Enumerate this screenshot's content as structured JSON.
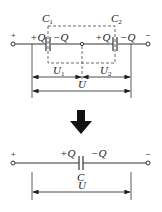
{
  "diagram": {
    "top": {
      "capacitors": [
        {
          "name": "C",
          "subscript": "1",
          "left_charge": "+Q",
          "right_charge": "−Q"
        },
        {
          "name": "C",
          "subscript": "2",
          "left_charge": "+Q",
          "right_charge": "−Q"
        }
      ],
      "terminals": {
        "left": "+",
        "right": "−"
      },
      "voltages": [
        {
          "name": "U",
          "subscript": "1"
        },
        {
          "name": "U",
          "subscript": "2"
        }
      ],
      "total_voltage": "U"
    },
    "arrow": "down",
    "bottom": {
      "capacitor": {
        "name": "C",
        "left_charge": "+Q",
        "right_charge": "−Q"
      },
      "terminals": {
        "left": "+",
        "right": "−"
      },
      "total_voltage": "U"
    },
    "colors": {
      "line": "#333333",
      "background": "#ffffff"
    }
  }
}
